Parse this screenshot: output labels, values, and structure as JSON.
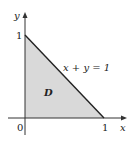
{
  "diagram": {
    "region_label": "D",
    "line_label": "x + y = 1",
    "axes": {
      "x_label": "x",
      "y_label": "y",
      "origin_label": "0",
      "x_tick_label": "1",
      "y_tick_label": "1"
    },
    "colors": {
      "fill": "#d9d9d9",
      "line": "#222222",
      "axis": "#333333"
    }
  }
}
